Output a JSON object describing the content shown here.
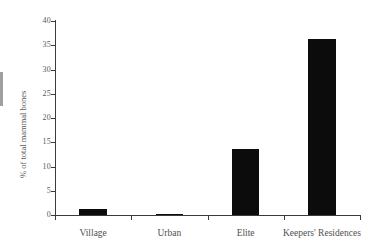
{
  "chart_data": {
    "type": "bar",
    "title": "",
    "subtitle": "",
    "xlabel": "",
    "ylabel": "% of total mammal bones",
    "categories": [
      "Village",
      "Urban",
      "Elite",
      "Keepers' Residences"
    ],
    "values": [
      1.2,
      0.2,
      13.6,
      36.3
    ],
    "series": [
      {
        "name": "% of total mammal bones",
        "values": [
          1.2,
          0.2,
          13.6,
          36.3
        ]
      }
    ],
    "ylim": [
      0,
      40
    ],
    "y_ticks": [
      0,
      5,
      10,
      15,
      20,
      25,
      30,
      35,
      40
    ],
    "y_tick_labels": [
      "0",
      "5",
      "10",
      "15",
      "20",
      "25",
      "30",
      "35",
      "40"
    ],
    "grid": false,
    "legend": false,
    "legend_position": "none",
    "bar_color": "#0c0c0c",
    "axis_color": "#3b3b3b",
    "background_color": "#ffffff"
  }
}
